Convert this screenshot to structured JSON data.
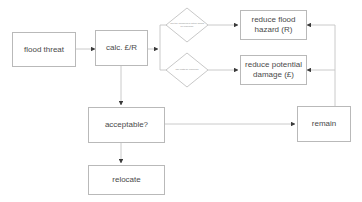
{
  "diagram": {
    "type": "flowchart",
    "theme": {
      "background": "#ffffff",
      "stroke": "#b9b9b9",
      "edge": "#c4c4c4",
      "arrow": "#3a3a3a",
      "text": "#4a4a4a",
      "small_text": "#8e8e8e"
    },
    "nodes": {
      "flood_threat": {
        "label": "flood threat",
        "shape": "box"
      },
      "calc": {
        "label": "calc. £/R",
        "shape": "box"
      },
      "decision_hazard": {
        "label": "can the likelihood of future floods be reduced?",
        "shape": "diamond"
      },
      "decision_damage": {
        "label": "can costs be reduced?",
        "shape": "diamond"
      },
      "reduce_hazard": {
        "label": "reduce flood hazard (R)",
        "shape": "box"
      },
      "reduce_damage": {
        "label": "reduce potential damage (£)",
        "shape": "box"
      },
      "acceptable": {
        "label": "acceptable?",
        "shape": "box"
      },
      "relocate": {
        "label": "relocate",
        "shape": "box"
      },
      "remain": {
        "label": "remain",
        "shape": "box"
      }
    },
    "edges": [
      {
        "from": "flood_threat",
        "to": "calc",
        "arrow": true
      },
      {
        "from": "calc",
        "to": "decision_hazard",
        "arrow": true
      },
      {
        "from": "calc",
        "to": "decision_damage",
        "arrow": true
      },
      {
        "from": "calc",
        "to": "acceptable",
        "arrow": true
      },
      {
        "from": "decision_hazard",
        "to": "reduce_hazard",
        "arrow": true
      },
      {
        "from": "decision_damage",
        "to": "reduce_damage",
        "arrow": true
      },
      {
        "from": "reduce_hazard",
        "to": "remain",
        "arrow": true
      },
      {
        "from": "reduce_damage",
        "to": "remain",
        "arrow": true
      },
      {
        "from": "acceptable",
        "to": "relocate",
        "arrow": true
      },
      {
        "from": "acceptable",
        "to": "remain",
        "arrow": true
      }
    ]
  }
}
